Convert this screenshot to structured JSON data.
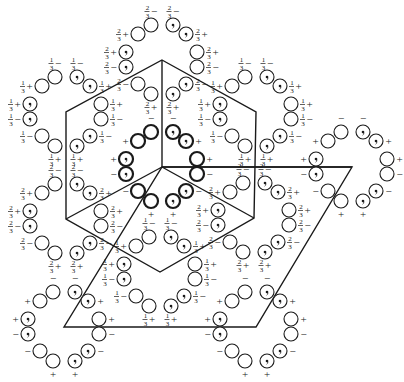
{
  "figure": {
    "width": 404,
    "height": 382,
    "background": "#ffffff",
    "ink": "#1a1a1a"
  },
  "outlines": {
    "hexagon": [
      [
        162,
        60
      ],
      [
        256,
        112
      ],
      [
        254,
        218
      ],
      [
        160,
        272
      ],
      [
        66,
        219
      ],
      [
        66,
        112
      ]
    ],
    "hexagon_spokes": [
      [
        [
          162,
          60
        ],
        [
          162,
          167
        ]
      ],
      [
        [
          162,
          167
        ],
        [
          352,
          167
        ]
      ],
      [
        [
          162,
          167
        ],
        [
          66,
          219
        ]
      ],
      [
        [
          162,
          167
        ],
        [
          254,
          218
        ]
      ]
    ],
    "parallelogram": [
      [
        162,
        167
      ],
      [
        352,
        167
      ],
      [
        256,
        327
      ],
      [
        64,
        327
      ]
    ]
  },
  "ring_template": [
    {
      "dx": -24,
      "dy": -26,
      "type": "plain",
      "side": "left",
      "sign": "+"
    },
    {
      "dx": -11,
      "dy": -35,
      "type": "plain",
      "side": "above",
      "sign": "−"
    },
    {
      "dx": 11,
      "dy": -35,
      "type": "comma",
      "side": "above",
      "sign": "−"
    },
    {
      "dx": 24,
      "dy": -26,
      "type": "comma",
      "side": "right",
      "sign": "+"
    },
    {
      "dx": 35,
      "dy": -8,
      "type": "plain",
      "side": "right",
      "sign": "+"
    },
    {
      "dx": 35,
      "dy": 7,
      "type": "plain",
      "side": "right",
      "sign": "−"
    },
    {
      "dx": 24,
      "dy": 24,
      "type": "comma",
      "side": "right",
      "sign": "−"
    },
    {
      "dx": 11,
      "dy": 34,
      "type": "comma",
      "side": "below",
      "sign": "+"
    },
    {
      "dx": -11,
      "dy": 34,
      "type": "plain",
      "side": "below",
      "sign": "+"
    },
    {
      "dx": -24,
      "dy": 24,
      "type": "plain",
      "side": "left",
      "sign": "−"
    },
    {
      "dx": -36,
      "dy": -8,
      "type": "comma",
      "side": "left",
      "sign": "+"
    },
    {
      "dx": -36,
      "dy": 7,
      "type": "comma",
      "side": "left",
      "sign": "−"
    }
  ],
  "rings": [
    {
      "id": "center",
      "cx": 162,
      "cy": 167,
      "height": "",
      "bold": true
    },
    {
      "id": "right-origin",
      "cx": 352,
      "cy": 167,
      "height": "",
      "bold": false
    },
    {
      "id": "bottom-left-origin",
      "cx": 64,
      "cy": 327,
      "height": "",
      "bold": false
    },
    {
      "id": "bottom-right-origin",
      "cx": 256,
      "cy": 327,
      "height": "",
      "bold": false
    },
    {
      "id": "top",
      "cx": 162,
      "cy": 60,
      "height": "2/3",
      "bold": false
    },
    {
      "id": "upper-left",
      "cx": 66,
      "cy": 112,
      "height": "1/3",
      "bold": false
    },
    {
      "id": "upper-right",
      "cx": 256,
      "cy": 112,
      "height": "1/3",
      "bold": false
    },
    {
      "id": "lower-left",
      "cx": 66,
      "cy": 219,
      "height": "2/3",
      "bold": false
    },
    {
      "id": "lower-right",
      "cx": 254,
      "cy": 218,
      "height": "2/3",
      "bold": false
    },
    {
      "id": "bottom",
      "cx": 160,
      "cy": 272,
      "height": "1/3",
      "bold": false
    }
  ],
  "style": {
    "circle_radius": 7,
    "comma_radius": 1.3
  }
}
